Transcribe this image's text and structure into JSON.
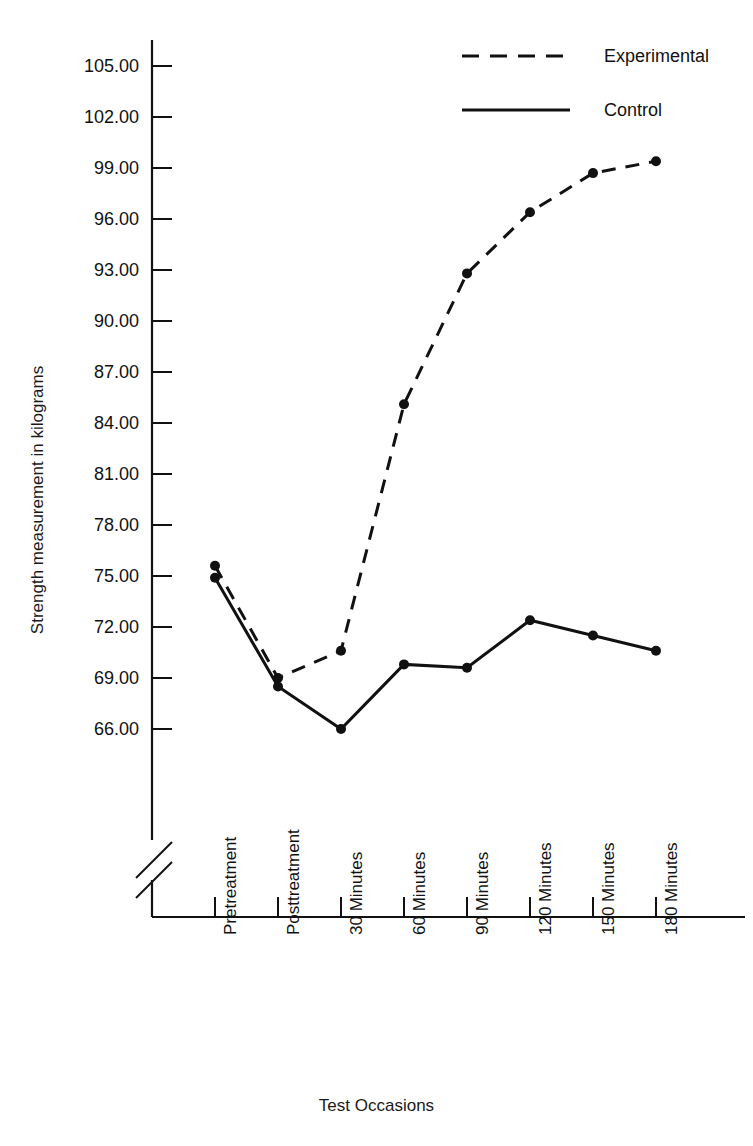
{
  "chart_data": {
    "type": "line",
    "title": "",
    "xlabel": "Test Occasions",
    "ylabel": "Strength measurement in kilograms",
    "categories": [
      "Pretreatment",
      "Posttreatment",
      "30 Minutes",
      "60 Minutes",
      "90 Minutes",
      "120 Minutes",
      "150 Minutes",
      "180 Minutes"
    ],
    "yticks": [
      "66.00",
      "69.00",
      "72.00",
      "75.00",
      "78.00",
      "81.00",
      "84.00",
      "87.00",
      "90.00",
      "93.00",
      "96.00",
      "99.00",
      "102.00",
      "105.00"
    ],
    "ytick_values": [
      66,
      69,
      72,
      75,
      78,
      81,
      84,
      87,
      90,
      93,
      96,
      99,
      102,
      105
    ],
    "ylim": [
      64.8,
      106.2
    ],
    "y_axis_break": true,
    "grid": false,
    "legend_position": "top-right",
    "series": [
      {
        "name": "Experimental",
        "style": "dashed",
        "color": "#111111",
        "marker": "circle",
        "values": [
          75.6,
          69.0,
          70.6,
          85.1,
          92.8,
          96.4,
          98.7,
          99.4
        ]
      },
      {
        "name": "Control",
        "style": "solid",
        "color": "#111111",
        "marker": "circle",
        "values": [
          74.9,
          68.5,
          66.0,
          69.8,
          69.6,
          72.4,
          71.5,
          70.6
        ]
      }
    ]
  },
  "legend": {
    "items": [
      {
        "label": "Experimental",
        "style": "dashed"
      },
      {
        "label": "Control",
        "style": "solid"
      }
    ]
  },
  "axes": {
    "y_title": "Strength measurement in kilograms",
    "x_title": "Test Occasions"
  }
}
